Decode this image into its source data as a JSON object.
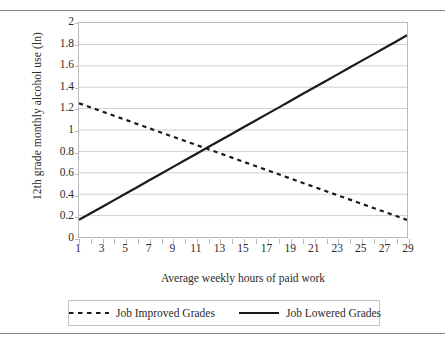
{
  "chart_data": {
    "type": "line",
    "title": "",
    "xlabel": "Average weekly hours of paid work",
    "ylabel": "12th grade monthly alcohol use (ln)",
    "xlim": [
      1,
      29
    ],
    "ylim": [
      0,
      2
    ],
    "grid": "horizontal",
    "legend_position": "bottom",
    "x": [
      1,
      2,
      3,
      4,
      5,
      6,
      7,
      8,
      9,
      10,
      11,
      12,
      13,
      14,
      15,
      16,
      17,
      18,
      19,
      20,
      21,
      22,
      23,
      24,
      25,
      26,
      27,
      28,
      29
    ],
    "x_tick_labels": [
      "1",
      "3",
      "5",
      "7",
      "9",
      "11",
      "13",
      "15",
      "17",
      "19",
      "21",
      "23",
      "25",
      "27",
      "29"
    ],
    "y_tick_labels": [
      "0",
      "0.2",
      "0.4",
      "0.6",
      "0.8",
      "1",
      "1.2",
      "1.4",
      "1.6",
      "1.8",
      "2"
    ],
    "series": [
      {
        "name": "Job Improved Grades",
        "style": "dashed",
        "color": "#1a1a1a",
        "values": [
          1.25,
          1.211,
          1.172,
          1.133,
          1.094,
          1.055,
          1.016,
          0.977,
          0.938,
          0.899,
          0.861,
          0.822,
          0.783,
          0.744,
          0.705,
          0.666,
          0.627,
          0.588,
          0.549,
          0.51,
          0.471,
          0.432,
          0.393,
          0.354,
          0.315,
          0.276,
          0.238,
          0.199,
          0.16
        ]
      },
      {
        "name": "Job Lowered Grades",
        "style": "solid",
        "color": "#1a1a1a",
        "values": [
          0.16,
          0.222,
          0.283,
          0.345,
          0.407,
          0.468,
          0.53,
          0.591,
          0.653,
          0.715,
          0.776,
          0.838,
          0.899,
          0.961,
          1.023,
          1.084,
          1.146,
          1.207,
          1.269,
          1.331,
          1.392,
          1.454,
          1.515,
          1.577,
          1.639,
          1.7,
          1.762,
          1.823,
          1.885
        ]
      }
    ]
  },
  "legend": {
    "entries": [
      {
        "label": "Job Improved Grades"
      },
      {
        "label": "Job Lowered Grades"
      }
    ]
  },
  "colors": {
    "line": "#1a1a1a",
    "grid": "#cfcfcf",
    "frame": "#b9b9b9",
    "rule": "#8a8a8a",
    "text": "#2b2b2b"
  }
}
